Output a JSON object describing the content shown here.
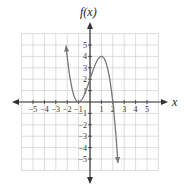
{
  "chart_data": {
    "type": "line",
    "title": "",
    "xlabel": "x",
    "ylabel": "f(x)",
    "xlim": [
      -6,
      6
    ],
    "ylim": [
      -6,
      6
    ],
    "grid": true,
    "x_ticks": [
      -5,
      -4,
      -3,
      -2,
      -1,
      1,
      2,
      3,
      4,
      5
    ],
    "y_ticks": [
      -5,
      -4,
      -3,
      -2,
      -1,
      1,
      2,
      3,
      4,
      5
    ],
    "series": [
      {
        "name": "f(x)",
        "function": "-(x+1)^2 (x-2)",
        "x_range": [
          -2.1,
          2.45
        ],
        "key_points": [
          {
            "x": -2,
            "y": 4
          },
          {
            "x": -1,
            "y": 0
          },
          {
            "x": 0,
            "y": 2
          },
          {
            "x": 1,
            "y": 4
          },
          {
            "x": 2,
            "y": 0
          },
          {
            "x": 2.4,
            "y": -4.6
          }
        ],
        "end_behavior": "arrows at both ends",
        "color": "#777777"
      }
    ]
  },
  "labels": {
    "x_axis": "x",
    "y_axis": "f(x)"
  },
  "colors": {
    "grid": "#cfcfcf",
    "axis": "#333333",
    "curve": "#777777"
  }
}
